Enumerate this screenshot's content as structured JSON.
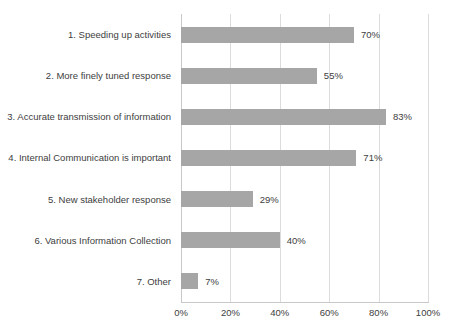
{
  "chart_data": {
    "type": "bar",
    "orientation": "horizontal",
    "title": "",
    "xlabel": "",
    "ylabel": "",
    "categories": [
      "1. Speeding up activities",
      "2. More finely tuned response",
      "3. Accurate transmission of information",
      "4. Internal Communication is important",
      "5. New stakeholder response",
      "6. Various Information Collection",
      "7. Other"
    ],
    "values": [
      70,
      55,
      83,
      71,
      29,
      40,
      7
    ],
    "value_labels": [
      "70%",
      "55%",
      "83%",
      "71%",
      "29%",
      "40%",
      "7%"
    ],
    "x_tick_labels": [
      "0%",
      "20%",
      "40%",
      "60%",
      "80%",
      "100%"
    ],
    "x_tick_values": [
      0,
      20,
      40,
      60,
      80,
      100
    ],
    "xlim": [
      0,
      100
    ],
    "grid": "vertical-gridlines-on",
    "legend": "none",
    "data_labels": "outside-end",
    "colors": {
      "bar": "#a6a6a6",
      "gridline": "#dcdcdc",
      "axis_line": "#c8c8c8",
      "text": "#404040",
      "background": "#ffffff"
    }
  }
}
